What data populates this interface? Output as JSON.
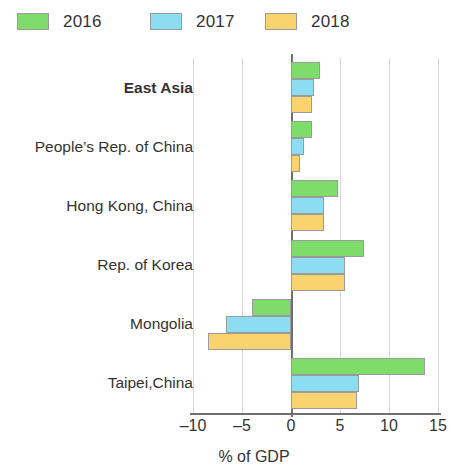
{
  "legend": {
    "items": [
      {
        "label": "2016",
        "color": "#7EDC6A",
        "icon": "legend-swatch-2016"
      },
      {
        "label": "2017",
        "color": "#8CDDF2",
        "icon": "legend-swatch-2017"
      },
      {
        "label": "2018",
        "color": "#F9D46E",
        "icon": "legend-swatch-2018"
      }
    ]
  },
  "chart_data": {
    "type": "bar",
    "orientation": "horizontal",
    "title": "",
    "xlabel": "% of GDP",
    "ylabel": "",
    "xlim": [
      -10,
      15
    ],
    "xticks": [
      -10,
      -5,
      0,
      5,
      10,
      15
    ],
    "xtick_labels": [
      "–10",
      "–5",
      "0",
      "5",
      "10",
      "15"
    ],
    "grid": true,
    "grid_axis": "x",
    "legend_position": "top-left",
    "categories": [
      "East Asia",
      "People’s Rep. of China",
      "Hong Kong, China",
      "Rep. of Korea",
      "Mongolia",
      "Taipei,China"
    ],
    "bold_categories": [
      "East Asia"
    ],
    "series": [
      {
        "name": "2016",
        "color": "#7EDC6A",
        "values": [
          3.0,
          2.1,
          4.8,
          7.4,
          -4.0,
          13.7
        ]
      },
      {
        "name": "2017",
        "color": "#8CDDF2",
        "values": [
          2.3,
          1.3,
          3.4,
          5.5,
          -6.6,
          6.9
        ]
      },
      {
        "name": "2018",
        "color": "#F9D46E",
        "values": [
          2.1,
          0.9,
          3.4,
          5.5,
          -8.5,
          6.7
        ]
      }
    ]
  }
}
